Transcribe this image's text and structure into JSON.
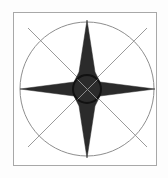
{
  "figure": {
    "kind": "compass-rose-diagram",
    "canvas": {
      "width": 168,
      "height": 178
    },
    "background_color": "#fdfdfd"
  },
  "frame": {
    "name": "outer-frame",
    "x": 13,
    "y": 12,
    "width": 144,
    "height": 154,
    "stroke_color": "#a8a8a8",
    "stroke_width": 1,
    "fill_color": "#ffffff"
  },
  "circle": {
    "name": "bearing-circle",
    "center_x": 87,
    "center_y": 89,
    "radius": 67,
    "stroke_color": "#8e8e8e",
    "stroke_width": 1,
    "fill": "none"
  },
  "diagonals": {
    "name": "diagonal-guides",
    "stroke_color": "#9a9a9a",
    "stroke_width": 1,
    "lines": [
      {
        "label": "nw-to-se",
        "x1": 28,
        "y1": 28,
        "x2": 147,
        "y2": 147
      },
      {
        "label": "ne-to-sw",
        "x1": 147,
        "y1": 28,
        "x2": 28,
        "y2": 147
      }
    ]
  },
  "star": {
    "name": "four-point-star",
    "fill_color": "#2b2b2b",
    "center_x": 87,
    "center_y": 89,
    "points": [
      {
        "direction": "north",
        "tip_x": 87,
        "tip_y": 20,
        "waist": 13
      },
      {
        "direction": "east",
        "tip_x": 155,
        "tip_y": 89,
        "waist": 13
      },
      {
        "direction": "south",
        "tip_x": 87,
        "tip_y": 158,
        "waist": 13
      },
      {
        "direction": "west",
        "tip_x": 20,
        "tip_y": 89,
        "waist": 13
      }
    ],
    "path": "M 87 20 L 95 72 L 100 82 L 155 89 L 100 96 L 95 106 L 87 158 L 79 106 L 74 96 L 20 89 L 74 82 L 79 72 Z"
  },
  "hub": {
    "name": "center-hub",
    "center_x": 87,
    "center_y": 89,
    "radius": 14,
    "fill_color": "#2b2b2b",
    "ring_stroke_color": "#111111",
    "ring_stroke_width": 2,
    "cross_stroke_color": "#8a8a8a",
    "cross_stroke_width": 1,
    "cross_lines": [
      {
        "label": "hub-cross-nw-se",
        "x1": 77,
        "y1": 79,
        "x2": 97,
        "y2": 99
      },
      {
        "label": "hub-cross-ne-sw",
        "x1": 97,
        "y1": 79,
        "x2": 77,
        "y2": 99
      }
    ]
  }
}
